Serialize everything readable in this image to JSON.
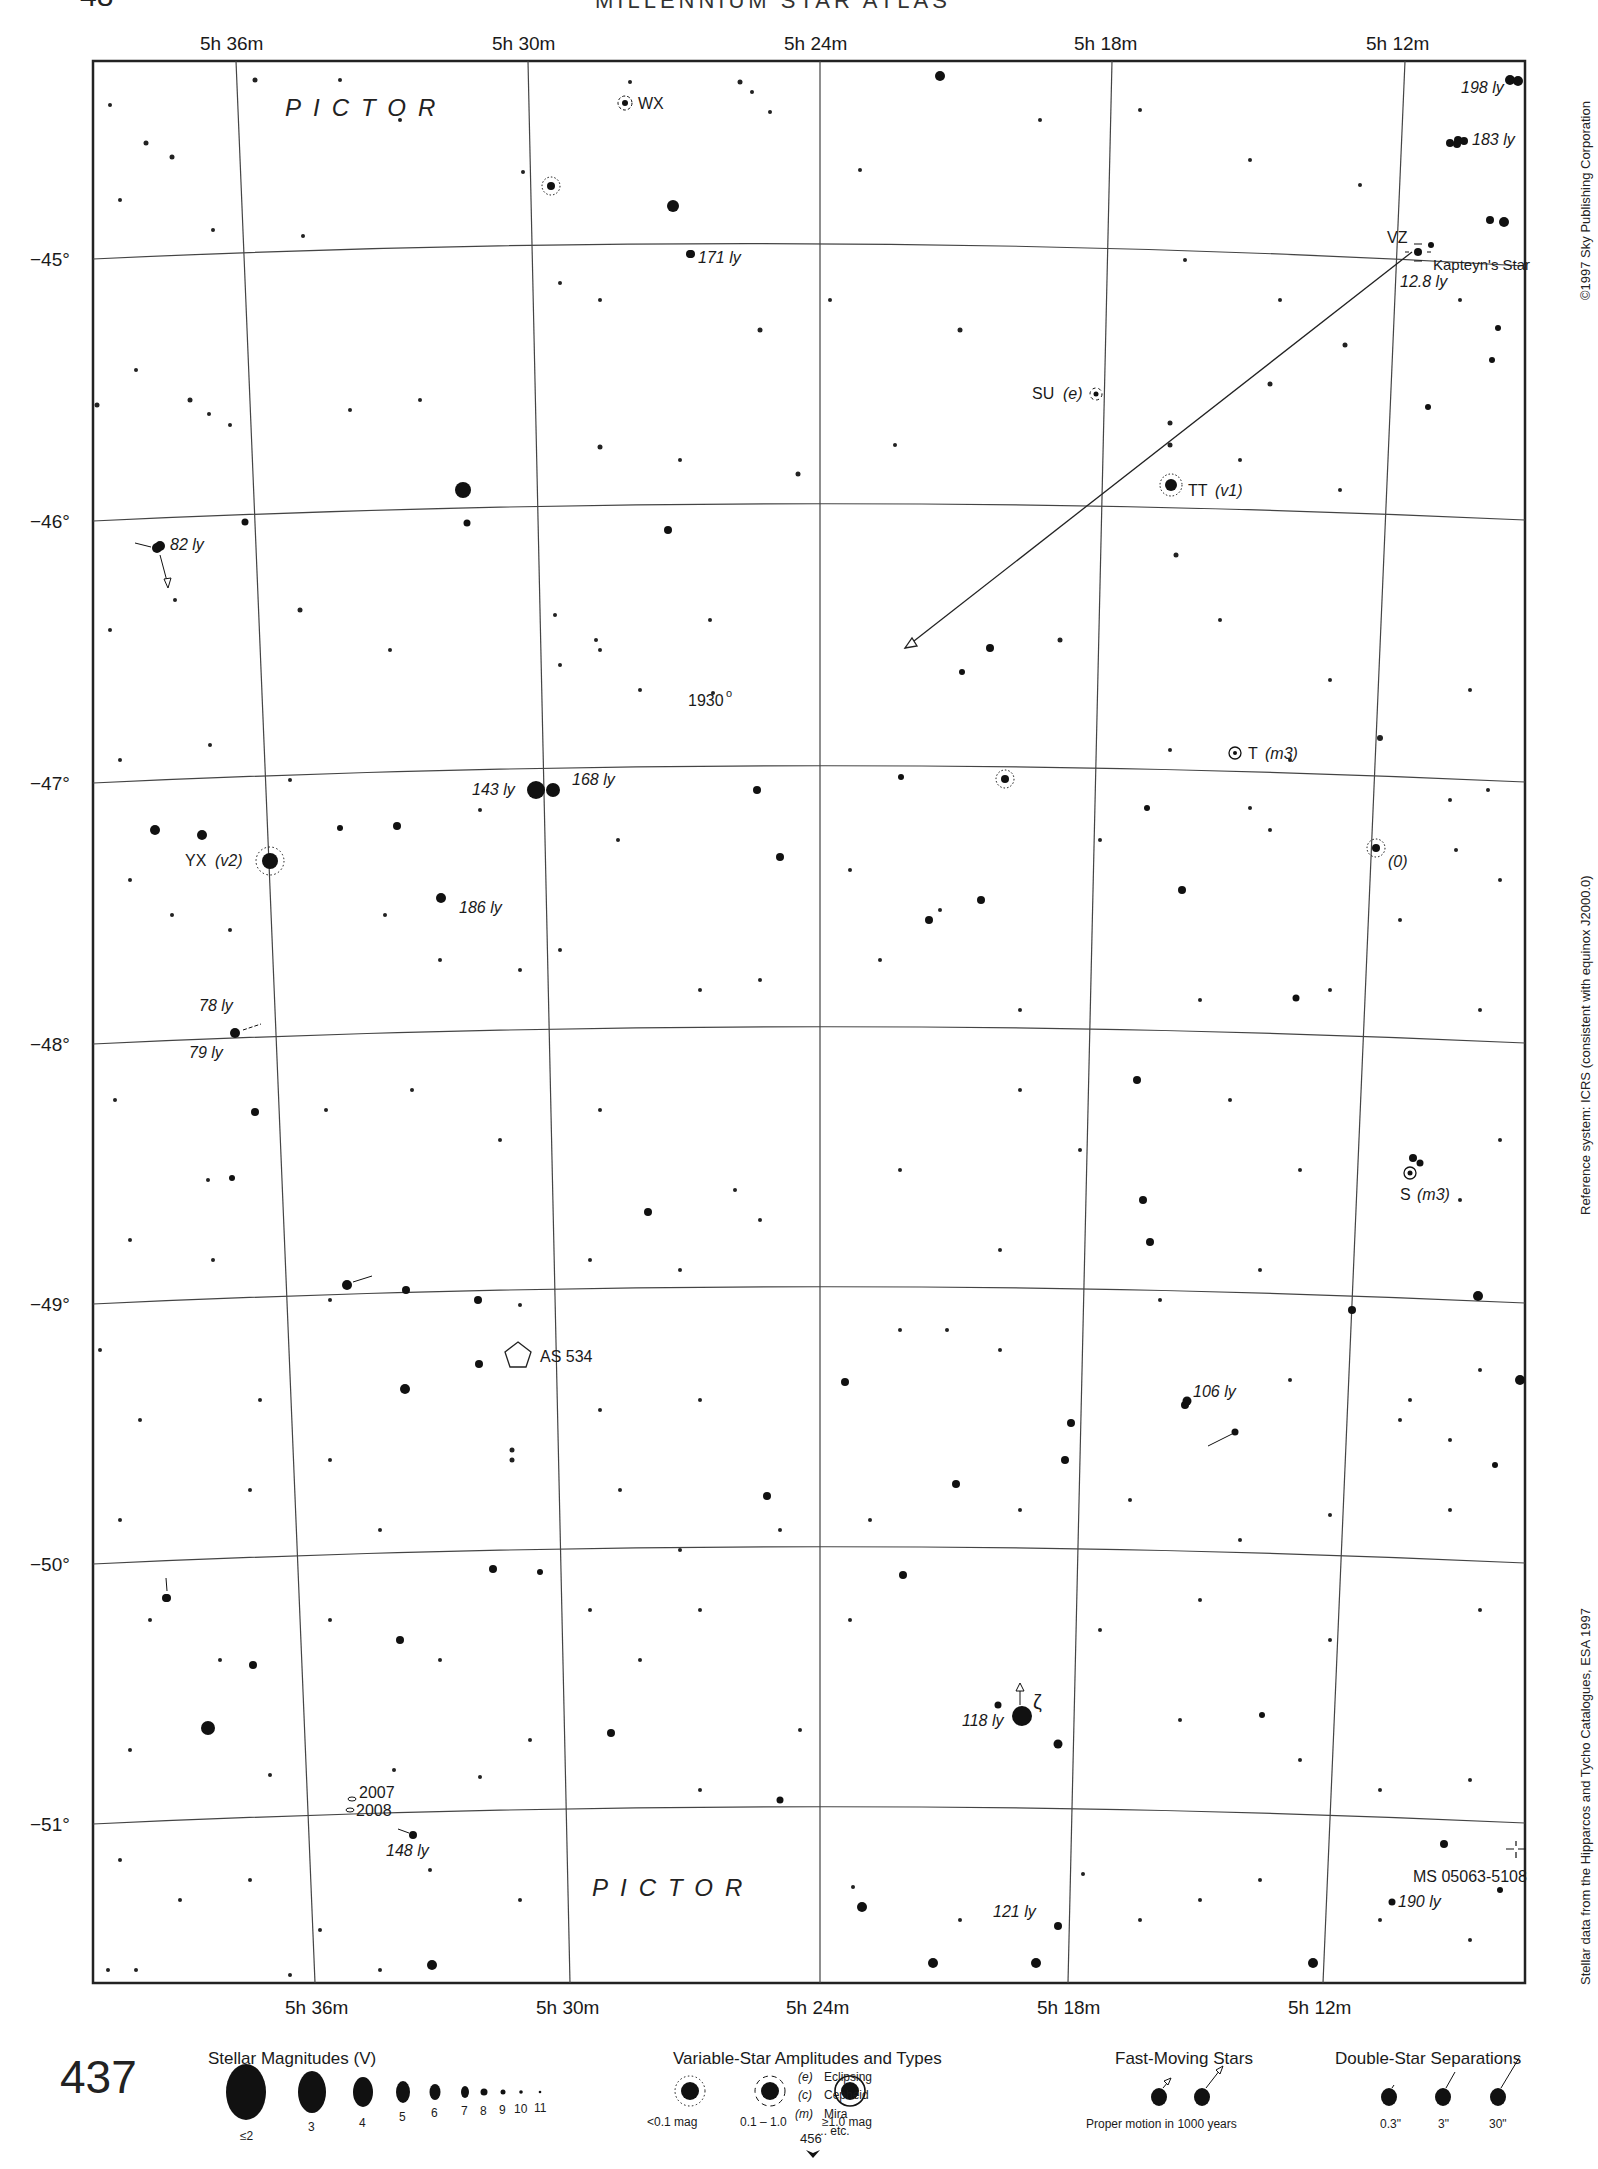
{
  "page": {
    "header_partial": "MILLENNIUM STAR ATLAS",
    "page_number_top": "48",
    "chart_number": "437",
    "continuation_page": "456"
  },
  "side_notes": {
    "copyright": "©1997 Sky Publishing Corporation",
    "reference": "Reference system: ICRS (consistent with equinox J2000.0)",
    "data_source": "Stellar data from the Hipparcos and Tycho Catalogues, ESA 1997"
  },
  "axes": {
    "ra_top": [
      "5h 36m",
      "5h 30m",
      "5h 24m",
      "5h 18m",
      "5h 12m"
    ],
    "ra_bottom": [
      "5h 36m",
      "5h 30m",
      "5h 24m",
      "5h 18m",
      "5h 12m"
    ],
    "dec": [
      "−45°",
      "−46°",
      "−47°",
      "−48°",
      "−49°",
      "−50°",
      "−51°"
    ]
  },
  "constellations": [
    "PICTOR",
    "PICTOR"
  ],
  "labels": {
    "wx": "WX",
    "ly198": "198 ly",
    "ly183": "183 ly",
    "ly171": "171 ly",
    "vz": "VZ",
    "kapteyn": "Kapteyn's Star",
    "ly128": "12.8 ly",
    "su": "SU",
    "su_type": "(e)",
    "tt": "TT",
    "tt_type": "(v1)",
    "ly82": "82 ly",
    "y1930": "1930",
    "t": "T",
    "t_type": "(m3)",
    "ly143": "143 ly",
    "ly168": "168 ly",
    "yx": "YX",
    "yx_type": "(v2)",
    "zero": "(0)",
    "ly186": "186 ly",
    "ly78": "78 ly",
    "ly79": "79 ly",
    "s": "S",
    "s_type": "(m3)",
    "as534": "AS 534",
    "ly106": "106 ly",
    "ly118": "118 ly",
    "zeta": "ζ",
    "y2007": "2007",
    "y2008": "2008",
    "ly148": "148 ly",
    "ms": "MS 05063-5108",
    "ly121": "121 ly",
    "ly190": "190 ly"
  },
  "legend": {
    "magnitudes": {
      "title": "Stellar Magnitudes (V)",
      "items": [
        "≤2",
        "3",
        "4",
        "5",
        "6",
        "7",
        "8",
        "9",
        "10",
        "11"
      ]
    },
    "variables": {
      "title": "Variable-Star Amplitudes and Types",
      "amplitudes": [
        "<0.1 mag",
        "0.1 – 1.0",
        "≥1.0 mag"
      ],
      "types": [
        {
          "code": "(e)",
          "name": "Eclipsing"
        },
        {
          "code": "(c)",
          "name": "Cepheid"
        },
        {
          "code": "(m)",
          "name": "Mira"
        },
        {
          "code": "",
          "name": "... etc."
        }
      ]
    },
    "fast_moving": {
      "title": "Fast-Moving Stars",
      "caption": "Proper motion in 1000 years"
    },
    "doubles": {
      "title": "Double-Star Separations",
      "items": [
        "0.3\"",
        "3\"",
        "30\""
      ]
    }
  },
  "colors": {
    "ink": "#111111",
    "grid": "#444444",
    "paper": "#ffffff"
  }
}
